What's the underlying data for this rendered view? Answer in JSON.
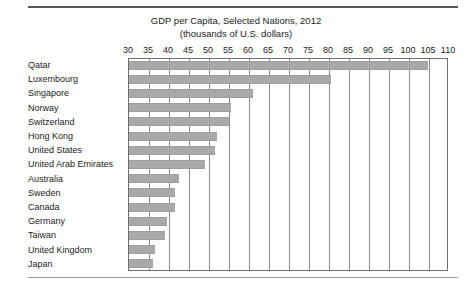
{
  "chart_data": {
    "type": "bar",
    "orientation": "horizontal",
    "title": "GDP per Capita, Selected Nations, 2012",
    "subtitle": "(thousands of U.S. dollars)",
    "xlabel": "",
    "ylabel": "",
    "xlim": [
      30,
      110
    ],
    "xticks": [
      30,
      35,
      40,
      45,
      50,
      55,
      60,
      65,
      70,
      75,
      80,
      85,
      90,
      95,
      100,
      105,
      110
    ],
    "grid": true,
    "legend": false,
    "bar_color": "#a9a9a9",
    "categories": [
      "Qatar",
      "Luxembourg",
      "Singapore",
      "Norway",
      "Switzerland",
      "Hong Kong",
      "United States",
      "United Arab Emirates",
      "Australia",
      "Sweden",
      "Canada",
      "Germany",
      "Taiwan",
      "United Kingdom",
      "Japan"
    ],
    "values": [
      104.7,
      80.5,
      61.0,
      55.5,
      55.0,
      52.0,
      51.5,
      49.0,
      42.5,
      41.5,
      41.5,
      39.5,
      39.0,
      36.5,
      36.0
    ]
  }
}
